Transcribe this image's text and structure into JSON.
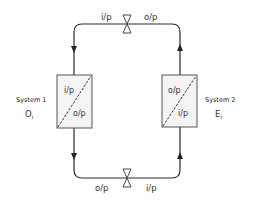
{
  "diagram": {
    "top_pipe": {
      "left_label": "i/p",
      "right_label": "o/p"
    },
    "bottom_pipe": {
      "left_label": "o/p",
      "right_label": "i/p"
    },
    "system1": {
      "name": "System 1",
      "symbol": "O",
      "subscript": "i",
      "box_top": "i/p",
      "box_bottom": "o/p"
    },
    "system2": {
      "name": "System 2",
      "symbol": "E",
      "subscript": "i",
      "box_top": "o/p",
      "box_bottom": "i/p"
    },
    "icons": {
      "valve": "bowtie-valve-icon",
      "flow_arrow": "triangle-arrow-icon"
    }
  }
}
